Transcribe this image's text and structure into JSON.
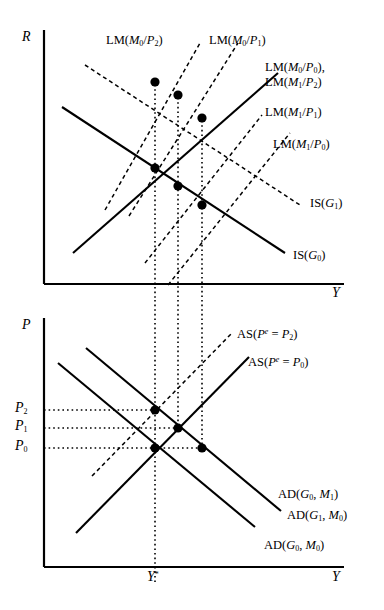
{
  "figure": {
    "type": "diagram"
  },
  "top_panel": {
    "y_axis_label": "R",
    "x_axis_label": "Y",
    "curve_labels": {
      "lm_m0_p2": "LM(M0/P2)",
      "lm_m0_p1": "LM(M0/P1)",
      "lm_m0_p0": "LM(M0/P0),",
      "lm_m1_p2": "LM(M1/P2)",
      "lm_m1_p1": "LM(M1/P1)",
      "lm_m1_p0": "LM(M1/P0)",
      "is_g1": "IS(G1)",
      "is_g0": "IS(G0)"
    }
  },
  "bottom_panel": {
    "y_axis_label": "P",
    "x_axis_label": "Y",
    "tick_labels": {
      "p2": "P2",
      "p1": "P1",
      "p0": "P0",
      "y_star": "Y*"
    },
    "curve_labels": {
      "as_pe_p2": "AS(Pe = P2)",
      "as_pe_p0": "AS(Pe = P0)",
      "ad_g0_m1": "AD(G0, M1)",
      "ad_g1_m0": "AD(G1, M0)",
      "ad_g0_m0": "AD(G0, M0)"
    }
  },
  "colors": {
    "ink": "#000000",
    "background": "#ffffff"
  }
}
